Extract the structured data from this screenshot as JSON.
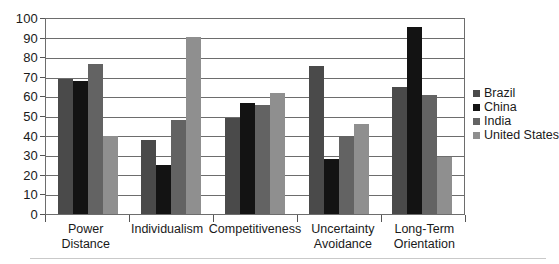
{
  "chart_data": {
    "type": "bar",
    "title": "",
    "xlabel": "",
    "ylabel": "",
    "ylim": [
      0,
      100
    ],
    "ytick_step": 10,
    "yticks": [
      100,
      90,
      80,
      70,
      60,
      50,
      40,
      30,
      20,
      10,
      0
    ],
    "grid": true,
    "legend_position": "right",
    "categories": [
      "Power Distance",
      "Individualism",
      "Competitiveness",
      "Uncertainty Avoidance",
      "Long-Term Orientation"
    ],
    "series": [
      {
        "name": "Brazil",
        "color": "#4a4a4a",
        "values": [
          69,
          38,
          49,
          76,
          65
        ]
      },
      {
        "name": "China",
        "color": "#131313",
        "values": [
          68,
          25,
          57,
          28,
          96
        ]
      },
      {
        "name": "India",
        "color": "#636363",
        "values": [
          77,
          48,
          56,
          40,
          61
        ]
      },
      {
        "name": "United States",
        "color": "#8f8f8f",
        "values": [
          40,
          91,
          62,
          46,
          29
        ]
      }
    ]
  },
  "legend": {
    "entries": [
      {
        "label": "Brazil",
        "color": "#4a4a4a"
      },
      {
        "label": "China",
        "color": "#131313"
      },
      {
        "label": "India",
        "color": "#636363"
      },
      {
        "label": "United States",
        "color": "#8f8f8f"
      }
    ]
  },
  "axis": {
    "y_labels": [
      "100",
      "90",
      "80",
      "70",
      "60",
      "50",
      "40",
      "30",
      "20",
      "10",
      "0"
    ],
    "x_labels": [
      "Power Distance",
      "Individualism",
      "Competitiveness",
      "Uncertainty Avoidance",
      "Long-Term Orientation"
    ]
  },
  "colors": {
    "axis_line": "#6d6d6d",
    "gridline": "#6d6d6d",
    "text": "#1a1a1a",
    "rule": "#c9c9c9",
    "background": "#ffffff"
  }
}
